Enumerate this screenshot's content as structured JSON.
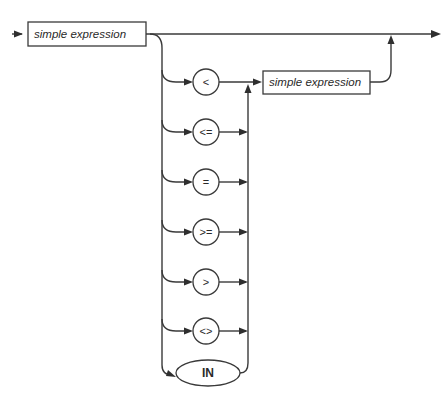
{
  "diagram": {
    "type": "syntax-diagram",
    "start_box": {
      "label": "simple expression"
    },
    "operators": [
      {
        "label": "<"
      },
      {
        "label": "<="
      },
      {
        "label": "="
      },
      {
        "label": ">="
      },
      {
        "label": ">"
      },
      {
        "label": "<>"
      }
    ],
    "keyword": {
      "label": "IN"
    },
    "end_box": {
      "label": "simple expression"
    },
    "colors": {
      "line": "#3a3a3a",
      "background": "#ffffff"
    }
  }
}
